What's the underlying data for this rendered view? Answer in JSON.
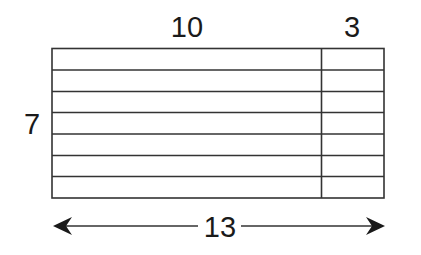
{
  "diagram": {
    "type": "area-model-grid",
    "labels": {
      "top_left_width": "10",
      "top_right_width": "3",
      "left_height": "7",
      "bottom_total_width": "13"
    },
    "rows": 7,
    "columns": [
      {
        "name": "left-section",
        "width": 10
      },
      {
        "name": "right-section",
        "width": 3
      }
    ],
    "colors": {
      "stroke": "#333333",
      "text": "#1a1a1a",
      "background": "#ffffff"
    }
  }
}
